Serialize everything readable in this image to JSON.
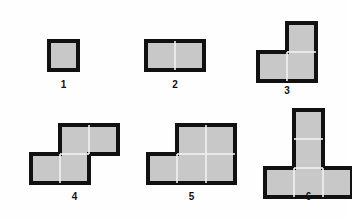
{
  "canvas": {
    "width": 346,
    "height": 220,
    "background_color": "#fefefe",
    "title": "Polyomino shape series"
  },
  "style": {
    "cell_size": 29,
    "fill_color": "#c8c8c8",
    "stroke_color": "#111111",
    "stroke_width": 4,
    "divider_color": "#f2f2f2",
    "label_color": "#111111"
  },
  "figures": [
    {
      "label": "1",
      "name": "monomino",
      "cells": [
        [
          0,
          0
        ]
      ],
      "columns": 1,
      "rows": 1,
      "cell_count": 1,
      "origin_x": 49,
      "origin_y": 41,
      "label_x": 49,
      "label_y": 79,
      "label_width": 29
    },
    {
      "label": "2",
      "name": "domino",
      "cells": [
        [
          0,
          0
        ],
        [
          1,
          0
        ]
      ],
      "columns": 2,
      "rows": 1,
      "cell_count": 2,
      "origin_x": 146,
      "origin_y": 41,
      "label_x": 146,
      "label_y": 79,
      "label_width": 58
    },
    {
      "label": "3",
      "name": "l-tromino",
      "cells": [
        [
          1,
          0
        ],
        [
          0,
          1
        ],
        [
          1,
          1
        ]
      ],
      "columns": 2,
      "rows": 2,
      "cell_count": 3,
      "origin_x": 258,
      "origin_y": 23,
      "label_x": 258,
      "label_y": 85,
      "label_width": 58
    },
    {
      "label": "4",
      "name": "s-tetromino",
      "cells": [
        [
          1,
          0
        ],
        [
          2,
          0
        ],
        [
          0,
          1
        ],
        [
          1,
          1
        ]
      ],
      "columns": 3,
      "rows": 2,
      "cell_count": 4,
      "origin_x": 31,
      "origin_y": 125,
      "label_x": 31,
      "label_y": 191,
      "label_width": 87
    },
    {
      "label": "5",
      "name": "p-pentomino",
      "cells": [
        [
          1,
          0
        ],
        [
          2,
          0
        ],
        [
          0,
          1
        ],
        [
          1,
          1
        ],
        [
          2,
          1
        ]
      ],
      "columns": 3,
      "rows": 2,
      "cell_count": 5,
      "origin_x": 148,
      "origin_y": 125,
      "label_x": 148,
      "label_y": 191,
      "label_width": 87
    },
    {
      "label": "6",
      "name": "t-pentomino",
      "cells": [
        [
          1,
          0
        ],
        [
          1,
          1
        ],
        [
          0,
          2
        ],
        [
          1,
          2
        ],
        [
          2,
          2
        ]
      ],
      "columns": 3,
      "rows": 3,
      "cell_count": 5,
      "origin_x": 265,
      "origin_y": 110,
      "label_x": 265,
      "label_y": 191,
      "label_width": 87
    }
  ]
}
